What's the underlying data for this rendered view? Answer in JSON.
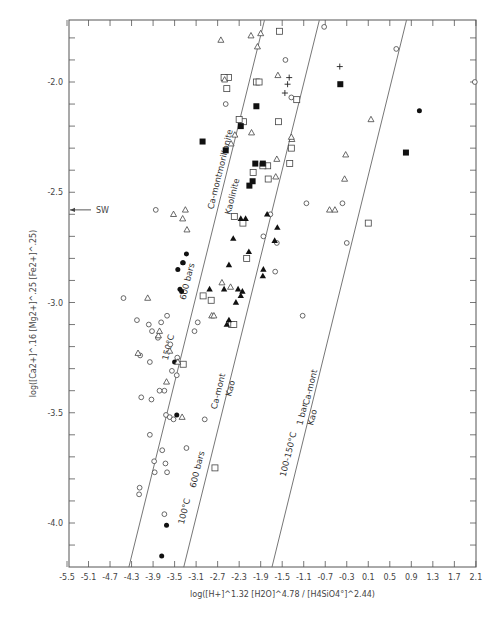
{
  "chart_data": {
    "type": "scatter",
    "title": "",
    "xlabel": "log([H+]^1.32 [H2O]^4.78 / [H4SiO4°]^2.44)",
    "ylabel": "log([Ca2+]^.16 [Mg2+]^.25 [Fe2+]^.25)",
    "xlim": [
      -5.5,
      2.1
    ],
    "ylim": [
      -4.2,
      -1.72
    ],
    "grid": false,
    "x_ticks": [
      -5.5,
      -5.1,
      -4.7,
      -4.3,
      -3.9,
      -3.5,
      -3.1,
      -2.7,
      -2.3,
      -1.9,
      -1.5,
      -1.1,
      -0.7,
      -0.3,
      0.1,
      0.5,
      0.9,
      1.3,
      1.7,
      2.1
    ],
    "x_tick_labels": [
      "-5.5",
      "-5.1",
      "-4.7",
      "-4.3",
      "-3.9",
      "-3.5",
      "-3.1",
      "-2.7",
      "-2.3",
      "-1.9",
      "-1.5",
      "-1.1",
      "-0.7",
      "-0.3",
      "0.1",
      "0.5",
      "0.9",
      "1.3",
      "1.7",
      "2.1"
    ],
    "y_ticks": [
      -2.0,
      -2.5,
      -3.0,
      -3.5,
      -4.0
    ],
    "y_tick_labels": [
      "-2.0",
      "-2.5",
      "-3.0",
      "-3.5",
      "-4.0"
    ],
    "annotations": [
      {
        "text": "SW",
        "x": -5.5,
        "y": -2.58,
        "type": "arrow"
      }
    ],
    "boundary_lines": [
      {
        "name": "Ca-montmorillonite / Kaolinite 150°C 600 bars",
        "x0": -4.35,
        "y0": -4.2,
        "x1": -1.83,
        "y1": -1.72,
        "labels": [
          "Ca-montmorillonite",
          "Kaolinite",
          "600 bars",
          "150°C"
        ]
      },
      {
        "name": "Ca-mont / Kao 100°C 600 bars",
        "x0": -3.33,
        "y0": -4.2,
        "x1": -0.81,
        "y1": -1.72,
        "labels": [
          "Ca-mont",
          "Kao",
          "100°C",
          "600 bars"
        ]
      },
      {
        "name": "Ca-mont / Kao 100-150°C 1 bar",
        "x0": -1.69,
        "y0": -4.2,
        "x1": 0.81,
        "y1": -1.72,
        "labels": [
          "100-150°C",
          "1 bar",
          "Ca-mont",
          "Kao"
        ]
      }
    ],
    "series": [
      {
        "name": "open circle",
        "marker": "o-open",
        "points": [
          [
            -0.72,
            -1.75
          ],
          [
            0.62,
            -1.85
          ],
          [
            2.08,
            -2.0
          ],
          [
            -1.44,
            -1.9
          ],
          [
            -1.33,
            -2.07
          ],
          [
            -2.55,
            -2.1
          ],
          [
            -1.05,
            -2.55
          ],
          [
            -3.85,
            -2.58
          ],
          [
            -1.6,
            -2.73
          ],
          [
            -0.38,
            -2.55
          ],
          [
            -0.3,
            -2.73
          ],
          [
            -1.12,
            -3.06
          ],
          [
            -1.85,
            -2.7
          ],
          [
            -1.63,
            -2.86
          ],
          [
            -1.72,
            -2.6
          ],
          [
            -2.17,
            -2.8
          ],
          [
            -4.45,
            -2.98
          ],
          [
            -4.2,
            -3.08
          ],
          [
            -3.64,
            -3.06
          ],
          [
            -3.75,
            -3.09
          ],
          [
            -3.98,
            -3.1
          ],
          [
            -3.92,
            -3.13
          ],
          [
            -3.81,
            -3.16
          ],
          [
            -3.58,
            -3.19
          ],
          [
            -3.45,
            -3.25
          ],
          [
            -3.07,
            -3.09
          ],
          [
            -3.13,
            -3.13
          ],
          [
            -4.14,
            -3.24
          ],
          [
            -3.96,
            -3.27
          ],
          [
            -3.55,
            -3.31
          ],
          [
            -3.46,
            -3.33
          ],
          [
            -4.12,
            -3.43
          ],
          [
            -3.69,
            -3.4
          ],
          [
            -3.78,
            -3.4
          ],
          [
            -3.93,
            -3.44
          ],
          [
            -3.66,
            -3.51
          ],
          [
            -3.59,
            -3.52
          ],
          [
            -3.52,
            -3.53
          ],
          [
            -2.94,
            -3.53
          ],
          [
            -3.96,
            -3.6
          ],
          [
            -3.28,
            -3.66
          ],
          [
            -3.73,
            -3.67
          ],
          [
            -3.88,
            -3.72
          ],
          [
            -3.67,
            -3.73
          ],
          [
            -3.87,
            -3.77
          ],
          [
            -3.64,
            -3.77
          ],
          [
            -4.15,
            -3.84
          ],
          [
            -4.16,
            -3.87
          ],
          [
            -3.69,
            -3.96
          ]
        ]
      },
      {
        "name": "filled circle",
        "marker": "o-filled",
        "points": [
          [
            1.05,
            -2.13
          ],
          [
            -3.28,
            -2.78
          ],
          [
            -3.34,
            -2.82
          ],
          [
            -3.44,
            -2.85
          ],
          [
            -3.35,
            -2.82
          ],
          [
            -3.4,
            -2.94
          ],
          [
            -3.37,
            -2.95
          ],
          [
            -3.5,
            -3.27
          ],
          [
            -3.46,
            -3.51
          ],
          [
            -3.65,
            -4.01
          ],
          [
            -3.74,
            -4.15
          ]
        ]
      },
      {
        "name": "open square",
        "marker": "s-open",
        "points": [
          [
            -1.55,
            -1.77
          ],
          [
            -2.5,
            -1.98
          ],
          [
            -2.58,
            -1.98
          ],
          [
            -2.53,
            -2.03
          ],
          [
            -1.98,
            -2.0
          ],
          [
            -1.93,
            -2.0
          ],
          [
            -1.23,
            -2.08
          ],
          [
            -2.22,
            -2.18
          ],
          [
            -1.57,
            -2.18
          ],
          [
            -1.33,
            -2.3
          ],
          [
            -2.3,
            -2.17
          ],
          [
            -1.77,
            -2.38
          ],
          [
            -2.04,
            -2.41
          ],
          [
            -1.86,
            -2.38
          ],
          [
            -1.36,
            -2.37
          ],
          [
            -2.39,
            -2.61
          ],
          [
            -2.23,
            -2.64
          ],
          [
            -2.16,
            -2.8
          ],
          [
            -2.82,
            -2.99
          ],
          [
            -2.97,
            -2.97
          ],
          [
            -2.44,
            -3.1
          ],
          [
            -2.4,
            -3.1
          ],
          [
            -3.34,
            -3.28
          ],
          [
            -2.75,
            -3.75
          ],
          [
            0.1,
            -2.64
          ],
          [
            -1.76,
            -2.44
          ]
        ]
      },
      {
        "name": "filled square",
        "marker": "s-filled",
        "points": [
          [
            -0.42,
            -2.01
          ],
          [
            -2.27,
            -2.2
          ],
          [
            -2.55,
            -2.31
          ],
          [
            -2.98,
            -2.27
          ],
          [
            -2.0,
            -2.37
          ],
          [
            -1.86,
            -2.37
          ],
          [
            -1.98,
            -2.11
          ],
          [
            -2.05,
            -2.45
          ],
          [
            0.8,
            -2.32
          ],
          [
            -2.11,
            -2.47
          ]
        ]
      },
      {
        "name": "open triangle",
        "marker": "t-open",
        "points": [
          [
            -2.64,
            -1.81
          ],
          [
            -2.08,
            -1.79
          ],
          [
            -1.9,
            -1.78
          ],
          [
            -1.96,
            -1.84
          ],
          [
            -2.57,
            -1.99
          ],
          [
            -2.07,
            -2.23
          ],
          [
            -2.38,
            -2.24
          ],
          [
            -2.45,
            -2.28
          ],
          [
            -1.32,
            -2.26
          ],
          [
            -1.33,
            -2.25
          ],
          [
            -1.6,
            -2.35
          ],
          [
            -1.62,
            -2.43
          ],
          [
            -0.62,
            -2.58
          ],
          [
            0.15,
            -2.17
          ],
          [
            -0.32,
            -2.33
          ],
          [
            -0.34,
            -2.44
          ],
          [
            -0.52,
            -2.58
          ],
          [
            -3.52,
            -2.6
          ],
          [
            -3.35,
            -2.62
          ],
          [
            -3.3,
            -2.58
          ],
          [
            -3.27,
            -2.67
          ],
          [
            -2.46,
            -2.93
          ],
          [
            -2.81,
            -3.06
          ],
          [
            -2.77,
            -3.06
          ],
          [
            -4.0,
            -2.98
          ],
          [
            -3.8,
            -3.15
          ],
          [
            -3.59,
            -3.22
          ],
          [
            -3.78,
            -3.13
          ],
          [
            -4.18,
            -3.23
          ],
          [
            -3.44,
            -3.27
          ],
          [
            -3.65,
            -3.36
          ],
          [
            -3.36,
            -3.52
          ],
          [
            -2.62,
            -2.91
          ],
          [
            -1.58,
            -1.97
          ]
        ]
      },
      {
        "name": "filled triangle",
        "marker": "t-filled",
        "points": [
          [
            -2.41,
            -2.71
          ],
          [
            -2.12,
            -2.77
          ],
          [
            -2.27,
            -2.62
          ],
          [
            -2.18,
            -2.62
          ],
          [
            -1.78,
            -2.6
          ],
          [
            -1.59,
            -2.66
          ],
          [
            -2.49,
            -2.83
          ],
          [
            -1.86,
            -2.88
          ],
          [
            -2.32,
            -2.94
          ],
          [
            -2.24,
            -2.95
          ],
          [
            -2.27,
            -2.97
          ],
          [
            -2.36,
            -3.0
          ],
          [
            -2.58,
            -2.94
          ],
          [
            -2.85,
            -2.94
          ],
          [
            -2.53,
            -3.1
          ],
          [
            -2.49,
            -3.08
          ],
          [
            -1.85,
            -2.85
          ],
          [
            -1.64,
            -2.72
          ]
        ]
      },
      {
        "name": "plus",
        "marker": "plus",
        "points": [
          [
            -1.37,
            -1.98
          ],
          [
            -1.4,
            -2.01
          ],
          [
            -1.45,
            -2.05
          ],
          [
            -0.43,
            -1.93
          ]
        ]
      }
    ]
  }
}
